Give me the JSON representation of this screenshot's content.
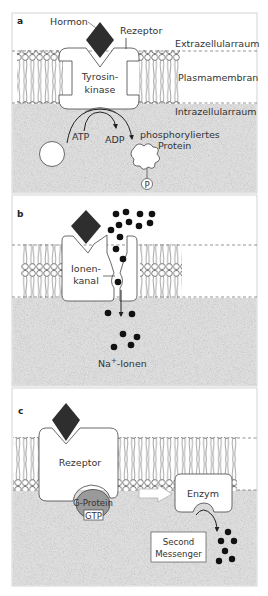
{
  "figure": {
    "panels": [
      {
        "id": "a",
        "letter": "a",
        "labels": {
          "hormone": "Hormon",
          "receptor": "Rezeptor",
          "extracellular": "Extrazellularraum",
          "membrane": "Plasmamembran",
          "intracellular": "Intrazellularraum",
          "enzyme_line1": "Tyrosin-",
          "enzyme_line2": "kinase",
          "atp": "ATP",
          "adp": "ADP",
          "protein_line1": "phosphoryliertes",
          "protein_line2": "Protein",
          "phosphate": "P"
        }
      },
      {
        "id": "b",
        "letter": "b",
        "labels": {
          "channel_line1": "Ionen-",
          "channel_line2": "kanal",
          "ions_base": "Na",
          "ions_sup": "+",
          "ions_suffix": "-Ionen"
        }
      },
      {
        "id": "c",
        "letter": "c",
        "labels": {
          "receptor": "Rezeptor",
          "g_protein": "G-Protein",
          "gtp": "GTP",
          "enzyme": "Enzym",
          "messenger_line1": "Second",
          "messenger_line2": "Messenger"
        }
      }
    ]
  },
  "colors": {
    "hormone": "#2e2e2e",
    "cytoplasm": "#d9d9d9",
    "g_protein": "#9a9a9a",
    "frame": "#c8c8c8",
    "ink": "#333333"
  }
}
